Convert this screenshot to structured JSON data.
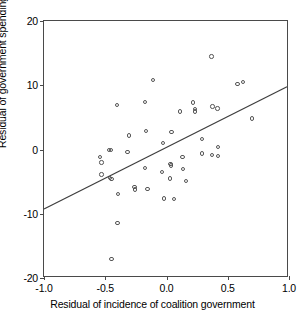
{
  "chart_data": {
    "type": "scatter",
    "title": "",
    "xlabel": "Residual of incidence of coalition government",
    "ylabel": "Residual of government spending",
    "xlim": [
      -1.0,
      1.0
    ],
    "ylim": [
      -20,
      20
    ],
    "xticks": [
      "-1.0",
      "-0.5",
      "0.0",
      "0.5",
      "1.0"
    ],
    "xtick_values": [
      -1.0,
      -0.5,
      0.0,
      0.5,
      1.0
    ],
    "yticks": [
      "20",
      "10",
      "0",
      "-10",
      "-20"
    ],
    "ytick_values": [
      20,
      10,
      0,
      -10,
      -20
    ],
    "grid": false,
    "legend": "none",
    "marker": "open-circle",
    "points": [
      {
        "x": -0.53,
        "y": -2.0
      },
      {
        "x": -0.545,
        "y": -1.2
      },
      {
        "x": -0.53,
        "y": -3.9
      },
      {
        "x": -0.47,
        "y": -0.1
      },
      {
        "x": -0.455,
        "y": -0.1
      },
      {
        "x": -0.46,
        "y": -4.4
      },
      {
        "x": -0.45,
        "y": -4.6
      },
      {
        "x": -0.405,
        "y": 6.9
      },
      {
        "x": -0.395,
        "y": -6.9
      },
      {
        "x": -0.4,
        "y": -11.4
      },
      {
        "x": -0.448,
        "y": -17.0
      },
      {
        "x": -0.305,
        "y": 2.2
      },
      {
        "x": -0.318,
        "y": -0.4
      },
      {
        "x": -0.262,
        "y": -5.8
      },
      {
        "x": -0.258,
        "y": -6.2
      },
      {
        "x": -0.175,
        "y": 7.4
      },
      {
        "x": -0.165,
        "y": 2.9
      },
      {
        "x": -0.175,
        "y": -2.9
      },
      {
        "x": -0.155,
        "y": -6.1
      },
      {
        "x": -0.11,
        "y": 10.8
      },
      {
        "x": -0.03,
        "y": 1.0
      },
      {
        "x": -0.035,
        "y": -3.5
      },
      {
        "x": -0.02,
        "y": -7.6
      },
      {
        "x": 0.04,
        "y": 2.7
      },
      {
        "x": 0.032,
        "y": -2.3
      },
      {
        "x": 0.035,
        "y": -2.5
      },
      {
        "x": 0.03,
        "y": -4.5
      },
      {
        "x": 0.06,
        "y": -7.7
      },
      {
        "x": 0.11,
        "y": 5.9
      },
      {
        "x": 0.13,
        "y": -1.2
      },
      {
        "x": 0.135,
        "y": -3.0
      },
      {
        "x": 0.16,
        "y": -4.9
      },
      {
        "x": 0.215,
        "y": 7.3
      },
      {
        "x": 0.232,
        "y": 6.3
      },
      {
        "x": 0.235,
        "y": 5.9
      },
      {
        "x": 0.29,
        "y": 1.6
      },
      {
        "x": 0.292,
        "y": -0.6
      },
      {
        "x": 0.368,
        "y": 14.5
      },
      {
        "x": 0.375,
        "y": 6.7
      },
      {
        "x": 0.372,
        "y": -0.9
      },
      {
        "x": 0.415,
        "y": 6.4
      },
      {
        "x": 0.42,
        "y": 0.4
      },
      {
        "x": 0.42,
        "y": -1.0
      },
      {
        "x": 0.578,
        "y": 10.2
      },
      {
        "x": 0.625,
        "y": 10.5
      },
      {
        "x": 0.7,
        "y": 4.8
      }
    ],
    "fit_line": {
      "kind": "linear-regression",
      "x_start": -1.0,
      "y_start": -9.5,
      "x_end": 1.0,
      "y_end": 9.7
    }
  }
}
